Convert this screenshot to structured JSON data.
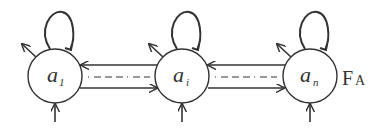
{
  "diagram": {
    "type": "state-transition",
    "nodes": [
      {
        "id": "a1",
        "label": "a",
        "subscript": "1",
        "cx": 55,
        "cy": 76
      },
      {
        "id": "ai",
        "label": "a",
        "subscript": "i",
        "cx": 182,
        "cy": 76
      },
      {
        "id": "an",
        "label": "a",
        "subscript": "n",
        "cx": 310,
        "cy": 76
      }
    ],
    "automaton_label": {
      "main": "F",
      "sub": "A"
    },
    "edges": [
      {
        "from": "a1",
        "to": "a1",
        "kind": "self-loop"
      },
      {
        "from": "ai",
        "to": "ai",
        "kind": "self-loop"
      },
      {
        "from": "an",
        "to": "an",
        "kind": "self-loop"
      },
      {
        "from": "ai",
        "to": "a1",
        "kind": "transition"
      },
      {
        "from": "a1",
        "to": "ai",
        "kind": "transition"
      },
      {
        "from": "an",
        "to": "ai",
        "kind": "transition"
      },
      {
        "from": "ai",
        "to": "an",
        "kind": "transition"
      }
    ],
    "colors": {
      "stroke": "#333333",
      "background": "#ffffff"
    }
  }
}
